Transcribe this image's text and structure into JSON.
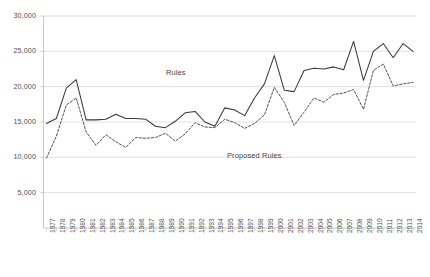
{
  "chart_data": {
    "type": "line",
    "title": "",
    "subtitle": "",
    "xlabel": "",
    "ylabel": "",
    "grid": true,
    "legend_position": "inline-annotation",
    "ylim": [
      0,
      30000
    ],
    "yticks": [
      5000,
      10000,
      15000,
      20000,
      25000,
      30000
    ],
    "ytick_labels": [
      "5,000",
      "10,000",
      "15,000",
      "20,000",
      "25,000",
      "30,000"
    ],
    "x": [
      1977,
      1978,
      1979,
      1980,
      1981,
      1982,
      1983,
      1984,
      1985,
      1986,
      1987,
      1988,
      1989,
      1990,
      1991,
      1992,
      1993,
      1994,
      1995,
      1996,
      1997,
      1998,
      1999,
      2000,
      2001,
      2002,
      2003,
      2004,
      2005,
      2006,
      2007,
      2008,
      2009,
      2010,
      2011,
      2012,
      2013,
      2014
    ],
    "xtick_labels": [
      "1977",
      "1978",
      "1979",
      "1980",
      "1981",
      "1982",
      "1983",
      "1984",
      "1985",
      "1986",
      "1987",
      "1988",
      "1989",
      "1990",
      "1991",
      "1992",
      "1993",
      "1994",
      "1995",
      "1996",
      "1997",
      "1998",
      "1999",
      "2000",
      "2001",
      "2002",
      "2003",
      "2004",
      "2005",
      "2006",
      "2007",
      "2008",
      "2009",
      "2010",
      "2011",
      "2012",
      "2013",
      "2014"
    ],
    "series": [
      {
        "name": "Rules",
        "style": "solid",
        "color": "#3a3a3a",
        "label_text": "Rules",
        "values": [
          14800,
          15500,
          19800,
          21000,
          15300,
          15300,
          15400,
          16100,
          15500,
          15500,
          15400,
          14400,
          14200,
          15100,
          16300,
          16500,
          15000,
          14400,
          17000,
          16700,
          15900,
          18400,
          20400,
          24400,
          19500,
          19300,
          22300,
          22600,
          22500,
          22800,
          22400,
          26400,
          20900,
          25000,
          26100,
          24100,
          26100,
          25000
        ]
      },
      {
        "name": "Proposed Rules",
        "style": "dashed",
        "color": "#4a4a4a",
        "label_text": "Proposed Rules",
        "values": [
          9900,
          13000,
          17400,
          18400,
          13600,
          11700,
          13200,
          12200,
          11400,
          12800,
          12700,
          12800,
          13400,
          12300,
          13300,
          14900,
          14300,
          14200,
          15400,
          14900,
          14100,
          14800,
          16000,
          19900,
          17800,
          14500,
          16400,
          18400,
          17800,
          18900,
          19100,
          19600,
          16800,
          22300,
          23200,
          20100,
          20400,
          20600
        ]
      }
    ]
  }
}
